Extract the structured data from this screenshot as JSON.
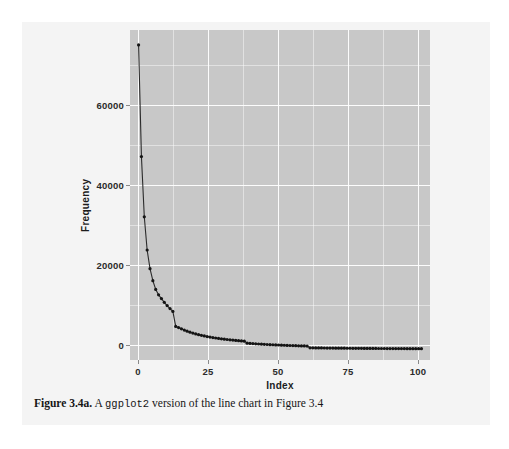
{
  "caption": {
    "label": "Figure 3.4a.",
    "text_before": "A",
    "code": "ggplot2",
    "text_after": "version of the line chart in Figure 3.4"
  },
  "colors": {
    "panel_background": "#c8c8c8",
    "gridline": "#ffffff",
    "line": "#2b2b2b",
    "point": "#141414",
    "page_background": "#f4f4f4",
    "tick_text": "#2b2b2b"
  },
  "chart_data": {
    "type": "line",
    "title": "",
    "subtitle": "",
    "xlabel": "Index",
    "ylabel": "Frequency",
    "xlim": [
      -2,
      103
    ],
    "ylim": [
      -2500,
      77000
    ],
    "grid": true,
    "legend": false,
    "legend_position": "none",
    "markers": true,
    "xticks": [
      0,
      25,
      50,
      75,
      100
    ],
    "xtick_labels": [
      "0",
      "25",
      "50",
      "75",
      "100"
    ],
    "yticks": [
      0,
      20000,
      40000,
      60000
    ],
    "ytick_labels": [
      "0",
      "20000",
      "40000",
      "60000"
    ],
    "x_minor_ticks": [
      12.5,
      37.5,
      62.5,
      87.5
    ],
    "y_minor_ticks": [
      10000,
      30000,
      50000,
      70000
    ],
    "series": [
      {
        "name": "Frequency",
        "x": [
          1,
          2,
          3,
          4,
          5,
          6,
          7,
          8,
          9,
          10,
          11,
          12,
          13,
          14,
          15,
          16,
          17,
          18,
          19,
          20,
          21,
          22,
          23,
          24,
          25,
          26,
          27,
          28,
          29,
          30,
          31,
          32,
          33,
          34,
          35,
          36,
          37,
          38,
          39,
          40,
          41,
          42,
          43,
          44,
          45,
          46,
          47,
          48,
          49,
          50,
          51,
          52,
          53,
          54,
          55,
          56,
          57,
          58,
          59,
          60,
          61,
          62,
          63,
          64,
          65,
          66,
          67,
          68,
          69,
          70,
          71,
          72,
          73,
          74,
          75,
          76,
          77,
          78,
          79,
          80,
          81,
          82,
          83,
          84,
          85,
          86,
          87,
          88,
          89,
          90,
          91,
          92,
          93,
          94,
          95,
          96,
          97,
          98,
          99,
          100
        ],
        "y": [
          73400,
          46500,
          32000,
          24000,
          19500,
          16600,
          14500,
          13200,
          12300,
          11400,
          10600,
          9900,
          9200,
          5600,
          5300,
          5000,
          4700,
          4450,
          4200,
          3980,
          3780,
          3600,
          3440,
          3290,
          3150,
          3030,
          2910,
          2800,
          2700,
          2610,
          2520,
          2440,
          2360,
          2290,
          2220,
          2160,
          2100,
          2040,
          1560,
          1500,
          1450,
          1400,
          1360,
          1320,
          1280,
          1240,
          1200,
          1170,
          1140,
          1110,
          1080,
          1050,
          1020,
          995,
          970,
          945,
          920,
          900,
          880,
          860,
          440,
          430,
          420,
          410,
          400,
          392,
          384,
          376,
          368,
          360,
          353,
          346,
          340,
          333,
          327,
          321,
          315,
          309,
          304,
          299,
          294,
          289,
          284,
          280,
          275,
          271,
          267,
          263,
          259,
          255,
          251,
          248,
          244,
          241,
          238,
          234,
          231,
          228,
          225,
          222
        ]
      }
    ]
  }
}
